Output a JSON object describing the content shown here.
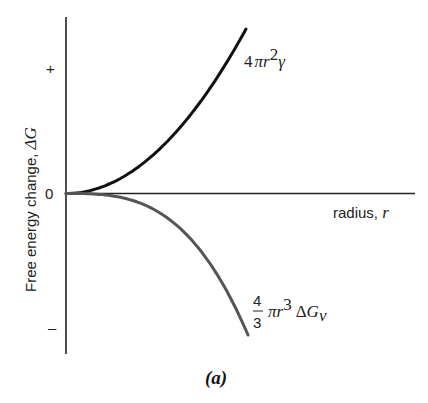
{
  "figure": {
    "caption": "(a)",
    "y_axis_label_text": "Free energy change, ",
    "y_axis_label_symbol": "ΔG",
    "x_axis_label_text": "radius, ",
    "x_axis_label_symbol": "r",
    "y_ticks": {
      "plus": "+",
      "zero": "0",
      "minus": "–"
    },
    "curve_upper_label": {
      "coef": "4",
      "pi": "π",
      "r": "r",
      "exp": "2",
      "gamma": "γ"
    },
    "curve_lower_label": {
      "num": "4",
      "den": "3",
      "pi": "π",
      "r": "r",
      "exp": "3",
      "delta": "Δ",
      "G": "G",
      "sub": "v"
    },
    "colors": {
      "axis": "#222222",
      "upper_curve": "#111111",
      "lower_curve": "#555555"
    }
  },
  "chart_data": {
    "type": "line",
    "title": "",
    "caption": "(a)",
    "xlabel": "radius, r",
    "ylabel": "Free energy change, ΔG",
    "y_tick_labels": [
      "+",
      "0",
      "–"
    ],
    "grid": false,
    "legend": "inline annotations",
    "series": [
      {
        "name": "4πr²γ (surface free energy)",
        "form": "r^2",
        "x": [
          0,
          0.25,
          0.5,
          0.75,
          1.0
        ],
        "y": [
          0,
          0.0625,
          0.25,
          0.5625,
          1.0
        ],
        "color": "#111111"
      },
      {
        "name": "4/3 πr³ ΔGv (volume free energy)",
        "form": "-r^3",
        "x": [
          0,
          0.25,
          0.5,
          0.75,
          1.0
        ],
        "y": [
          0,
          -0.0156,
          -0.125,
          -0.4219,
          -1.0
        ],
        "color": "#555555"
      }
    ],
    "xlim": [
      0,
      1.9
    ],
    "ylim": [
      -1.1,
      1.1
    ]
  }
}
